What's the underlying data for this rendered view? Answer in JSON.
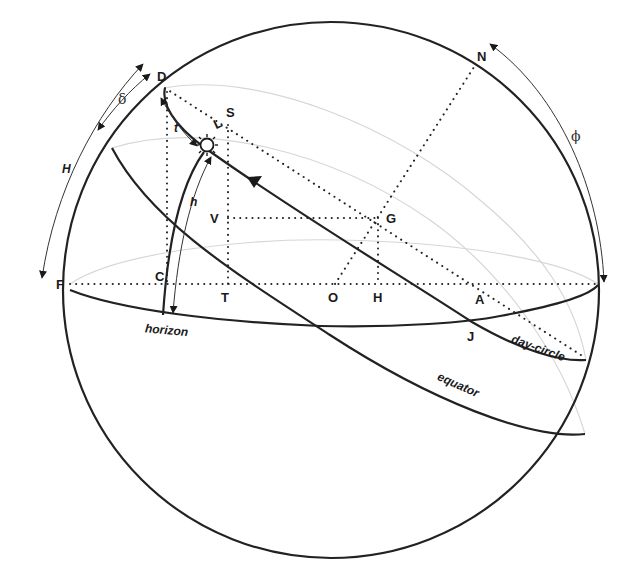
{
  "diagram": {
    "points": {
      "D": "D",
      "N": "N",
      "S": "S",
      "L": "L",
      "V": "V",
      "G": "G",
      "F": "F",
      "C": "C",
      "T": "T",
      "O": "O",
      "H": "H",
      "A": "A",
      "J": "J"
    },
    "angles": {
      "delta": "δ",
      "H": "H",
      "t": "t",
      "h": "h",
      "phi": "ϕ"
    },
    "curves": {
      "horizon": "horizon",
      "day_circle": "day-circle",
      "equator": "equator"
    },
    "colors": {
      "ink": "#222222",
      "back_lines": "#d6d6d6",
      "background": "#ffffff"
    }
  }
}
